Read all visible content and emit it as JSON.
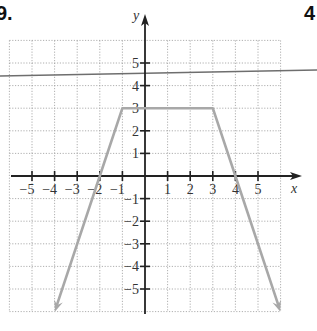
{
  "problem": {
    "left_number_fragment": "9.",
    "right_number_fragment": "4"
  },
  "axes": {
    "x_label": "x",
    "y_label": "y",
    "x_ticks": [
      "−5",
      "−4",
      "−3",
      "−2",
      "−1",
      "1",
      "2",
      "3",
      "4",
      "5"
    ],
    "y_ticks": [
      "5",
      "4",
      "3",
      "2",
      "1",
      "−1",
      "−2",
      "−3",
      "−4",
      "−5"
    ]
  },
  "colors": {
    "axis": "#222222",
    "grid": "#9a9a9a",
    "graph": "#a8a8a8",
    "overlay_line": "#6e6e6e"
  },
  "chart_data": {
    "type": "line",
    "title": "",
    "xlabel": "x",
    "ylabel": "y",
    "xlim": [
      -6,
      6
    ],
    "ylim": [
      -6,
      6
    ],
    "grid": true,
    "series": [
      {
        "name": "piecewise trapezoid graph",
        "points": [
          [
            -4,
            -6
          ],
          [
            -2,
            0
          ],
          [
            -1,
            3
          ],
          [
            3,
            3
          ],
          [
            4,
            0
          ],
          [
            6,
            -6
          ]
        ],
        "arrows_at_ends": true,
        "note": "slopes: 3 on left, 0 on top (y=3 from x=-1 to x=3), -3 on right"
      },
      {
        "name": "near-horizontal overlay line",
        "points": [
          [
            -6.4,
            4.35
          ],
          [
            7.5,
            4.6
          ]
        ]
      }
    ]
  }
}
